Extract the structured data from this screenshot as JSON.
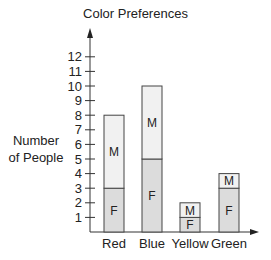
{
  "chart_data": {
    "type": "bar",
    "stacked": true,
    "title": "Color Preferences",
    "xlabel": "",
    "ylabel": "Number of People",
    "ylabel_lines": [
      "Number",
      "of People"
    ],
    "categories": [
      "Red",
      "Blue",
      "Yellow",
      "Green"
    ],
    "series": [
      {
        "name": "F",
        "values": [
          3,
          5,
          1,
          3
        ],
        "color": "#dcdcdc"
      },
      {
        "name": "M",
        "values": [
          5,
          5,
          1,
          1
        ],
        "color": "#f1f1f1"
      }
    ],
    "totals": [
      8,
      10,
      2,
      4
    ],
    "yticks": [
      1,
      2,
      3,
      4,
      5,
      6,
      7,
      8,
      9,
      10,
      11,
      12
    ],
    "ylim": [
      0,
      12
    ],
    "grid": false,
    "legend": "none (segments labeled inline with F and M)"
  }
}
